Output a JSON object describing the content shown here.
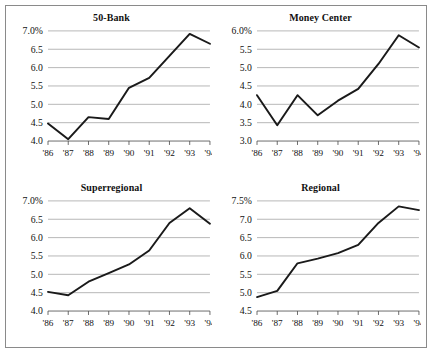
{
  "figure": {
    "background_color": "#ffffff",
    "border_color": "#8a8a8a",
    "line_color": "#1a1a1a",
    "grid_color": "#9a9a9a"
  },
  "chart_data": [
    {
      "type": "line",
      "title": "50-Bank",
      "xlabel": "",
      "ylabel": "",
      "grid": true,
      "legend": "none",
      "x": [
        "'86",
        "'87",
        "'88",
        "'89",
        "'90",
        "'91",
        "'92",
        "'93",
        "'94"
      ],
      "categories": [
        "'86",
        "'87",
        "'88",
        "'89",
        "'90",
        "'91",
        "'92",
        "'93",
        "'94"
      ],
      "values": [
        4.48,
        4.05,
        4.65,
        4.6,
        5.45,
        5.72,
        6.32,
        6.92,
        6.65
      ],
      "ylim": [
        4.0,
        7.0
      ],
      "yticks": [
        4.0,
        4.5,
        5.0,
        5.5,
        6.0,
        6.5,
        7.0
      ],
      "ytick_labels": [
        "4.0",
        "4.5",
        "5.0",
        "5.5",
        "6.0",
        "6.5",
        "7.0%"
      ]
    },
    {
      "type": "line",
      "title": "Money Center",
      "xlabel": "",
      "ylabel": "",
      "grid": true,
      "legend": "none",
      "x": [
        "'86",
        "'87",
        "'88",
        "'89",
        "'90",
        "'91",
        "'92",
        "'93",
        "'94"
      ],
      "categories": [
        "'86",
        "'87",
        "'88",
        "'89",
        "'90",
        "'91",
        "'92",
        "'93",
        "'94"
      ],
      "values": [
        4.25,
        3.43,
        4.25,
        3.7,
        4.1,
        4.42,
        5.1,
        5.88,
        5.55
      ],
      "ylim": [
        3.0,
        6.0
      ],
      "yticks": [
        3.0,
        3.5,
        4.0,
        4.5,
        5.0,
        5.5,
        6.0
      ],
      "ytick_labels": [
        "3.0",
        "3.5",
        "4.0",
        "4.5",
        "5.0",
        "5.5",
        "6.0%"
      ]
    },
    {
      "type": "line",
      "title": "Superregional",
      "xlabel": "",
      "ylabel": "",
      "grid": true,
      "legend": "none",
      "x": [
        "'86",
        "'87",
        "'88",
        "'89",
        "'90",
        "'91",
        "'92",
        "'93",
        "'94"
      ],
      "categories": [
        "'86",
        "'87",
        "'88",
        "'89",
        "'90",
        "'91",
        "'92",
        "'93",
        "'94"
      ],
      "values": [
        4.52,
        4.43,
        4.8,
        5.03,
        5.27,
        5.65,
        6.4,
        6.8,
        6.38
      ],
      "ylim": [
        4.0,
        7.0
      ],
      "yticks": [
        4.0,
        4.5,
        5.0,
        5.5,
        6.0,
        6.5,
        7.0
      ],
      "ytick_labels": [
        "4.0",
        "4.5",
        "5.0",
        "5.5",
        "6.0",
        "6.5",
        "7.0%"
      ]
    },
    {
      "type": "line",
      "title": "Regional",
      "xlabel": "",
      "ylabel": "",
      "grid": true,
      "legend": "none",
      "x": [
        "'86",
        "'87",
        "'88",
        "'89",
        "'90",
        "'91",
        "'92",
        "'93",
        "'94"
      ],
      "categories": [
        "'86",
        "'87",
        "'88",
        "'89",
        "'90",
        "'91",
        "'92",
        "'93",
        "'94"
      ],
      "values": [
        4.88,
        5.05,
        5.8,
        5.93,
        6.08,
        6.3,
        6.9,
        7.35,
        7.25
      ],
      "ylim": [
        4.5,
        7.5
      ],
      "yticks": [
        4.5,
        5.0,
        5.5,
        6.0,
        6.5,
        7.0,
        7.5
      ],
      "ytick_labels": [
        "4.5",
        "5.0",
        "5.5",
        "6.0",
        "6.5",
        "7.0",
        "7.5%"
      ]
    }
  ]
}
